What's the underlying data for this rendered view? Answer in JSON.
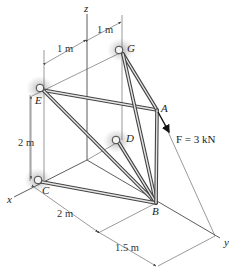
{
  "figure": {
    "type": "3D space truss diagram",
    "axes": {
      "x": "x",
      "y": "y",
      "z": "z"
    },
    "joints": [
      {
        "id": "A",
        "label": "A"
      },
      {
        "id": "B",
        "label": "B"
      },
      {
        "id": "C",
        "label": "C"
      },
      {
        "id": "D",
        "label": "D"
      },
      {
        "id": "E",
        "label": "E"
      },
      {
        "id": "G",
        "label": "G"
      }
    ],
    "supports": [
      "C",
      "D",
      "E",
      "G"
    ],
    "members": [
      "EA",
      "GA",
      "GB",
      "EB",
      "DB",
      "CB",
      "AB"
    ],
    "load": {
      "label": "F = 3 kN",
      "at": "A"
    },
    "dimensions": {
      "top_left": "1 m",
      "top_right": "1 m",
      "vertical": "2 m",
      "bottom_x": "2 m",
      "bottom_y": "1.5 m"
    }
  }
}
